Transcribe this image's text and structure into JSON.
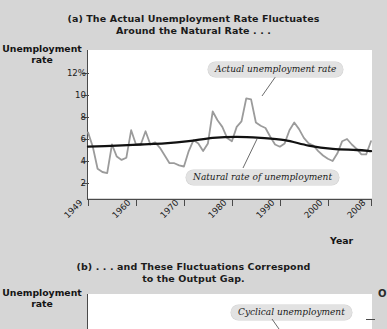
{
  "figure": {
    "background_color": "#d6d6d6",
    "plot_background_color": "#ffffff"
  },
  "panel_a": {
    "title_line1": "(a) The Actual Unemployment Rate Fluctuates",
    "title_line2": "Around the Natural Rate . . .",
    "y_axis_title_line1": "Unemployment",
    "y_axis_title_line2": "rate",
    "x_axis_title": "Year",
    "y_ticks": [
      "12%",
      "10",
      "8",
      "6",
      "4",
      "2"
    ],
    "x_ticks": [
      "1949",
      "1960",
      "1970",
      "1980",
      "1990",
      "2000",
      "2008"
    ],
    "annotation_actual": "Actual unemployment rate",
    "annotation_natural": "Natural rate of unemployment"
  },
  "panel_b": {
    "title_line1": "(b) . . . and These Fluctuations Correspond",
    "title_line2": "to the Output Gap.",
    "y_axis_title_line1": "Unemployment",
    "y_axis_title_line2": "rate",
    "annotation_cyclical": "Cyclical unemployment",
    "edge_letter": "O"
  },
  "chart_data": {
    "type": "line",
    "title": "(a) The Actual Unemployment Rate Fluctuates Around the Natural Rate . . .",
    "xlabel": "Year",
    "ylabel": "Unemployment rate",
    "xlim": [
      1949,
      2008
    ],
    "ylim": [
      1.0,
      13.0
    ],
    "yticks": [
      2,
      4,
      6,
      8,
      10,
      12
    ],
    "ytick_labels": [
      "2",
      "4",
      "6",
      "8",
      "10",
      "12%"
    ],
    "xticks": [
      1949,
      1960,
      1970,
      1980,
      1990,
      2000,
      2008
    ],
    "grid": false,
    "legend": "annotations",
    "series": [
      {
        "name": "Actual unemployment rate",
        "color": "#9b9b9b",
        "x": [
          1949,
          1950,
          1951,
          1952,
          1953,
          1954,
          1955,
          1956,
          1957,
          1958,
          1959,
          1960,
          1961,
          1962,
          1963,
          1964,
          1965,
          1966,
          1967,
          1968,
          1969,
          1970,
          1971,
          1972,
          1973,
          1974,
          1975,
          1976,
          1977,
          1978,
          1979,
          1980,
          1981,
          1982,
          1983,
          1984,
          1985,
          1986,
          1987,
          1988,
          1989,
          1990,
          1991,
          1992,
          1993,
          1994,
          1995,
          1996,
          1997,
          1998,
          1999,
          2000,
          2001,
          2002,
          2003,
          2004,
          2005,
          2006,
          2007,
          2008
        ],
        "values": [
          6.6,
          5.3,
          3.3,
          3.0,
          2.9,
          5.5,
          4.4,
          4.1,
          4.3,
          6.8,
          5.5,
          5.5,
          6.7,
          5.5,
          5.7,
          5.2,
          4.5,
          3.8,
          3.8,
          3.6,
          3.5,
          4.9,
          5.9,
          5.6,
          4.9,
          5.6,
          8.5,
          7.7,
          7.1,
          6.1,
          5.8,
          7.1,
          7.6,
          9.7,
          9.6,
          7.5,
          7.2,
          7.0,
          6.2,
          5.5,
          5.3,
          5.6,
          6.8,
          7.5,
          6.9,
          6.1,
          5.6,
          5.4,
          4.9,
          4.5,
          4.2,
          4.0,
          4.7,
          5.8,
          6.0,
          5.5,
          5.1,
          4.6,
          4.6,
          5.8
        ]
      },
      {
        "name": "Natural rate of unemployment",
        "color": "#111111",
        "x": [
          1949,
          1955,
          1960,
          1965,
          1970,
          1975,
          1980,
          1985,
          1990,
          1995,
          2000,
          2005,
          2008
        ],
        "values": [
          5.3,
          5.4,
          5.5,
          5.6,
          5.8,
          6.1,
          6.2,
          6.1,
          5.9,
          5.4,
          5.1,
          5.0,
          4.9
        ]
      }
    ]
  }
}
